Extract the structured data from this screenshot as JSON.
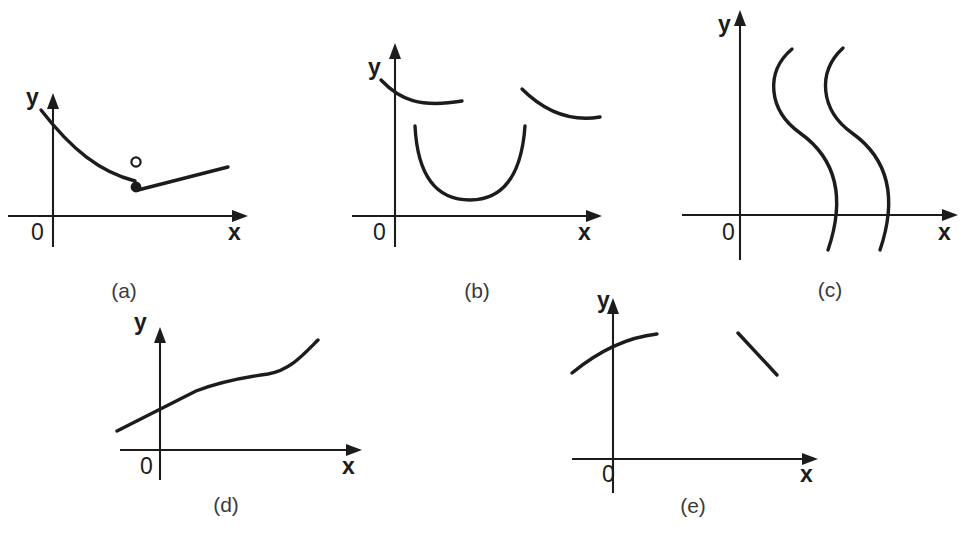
{
  "figure": {
    "width": 970,
    "height": 534,
    "background": "#ffffff",
    "ink_color": "#1c1c1c",
    "caption_color": "#3a3a3a"
  },
  "panels": [
    {
      "id": "a",
      "caption": "(a)",
      "caption_x": 124,
      "caption_y": 298,
      "axes": {
        "x_label": "x",
        "y_label": "y",
        "origin_label": "0",
        "x_label_x": 228,
        "x_label_y": 240,
        "y_label_x": 26,
        "y_label_y": 105,
        "origin_label_x": 31,
        "origin_label_y": 240,
        "x_axis_y": 216,
        "x_axis_x_start": 8,
        "x_axis_x_end": 248,
        "y_axis_x": 53,
        "y_axis_y_top": 93,
        "y_axis_y_bottom": 247
      },
      "curves": [
        {
          "name": "decreasing-branch",
          "path": "M 41 110 C 72 150 100 172 135 181"
        },
        {
          "name": "rising-segment",
          "path": "M 138 190 L 228 167"
        }
      ],
      "markers": [
        {
          "name": "open-circle-endpoint",
          "type": "open",
          "cx": 136,
          "cy": 162,
          "r": 4.6
        },
        {
          "name": "filled-dot-endpoint",
          "type": "filled",
          "cx": 136,
          "cy": 187,
          "r": 4.6
        }
      ]
    },
    {
      "id": "b",
      "caption": "(b)",
      "caption_x": 477,
      "caption_y": 298,
      "axes": {
        "x_label": "x",
        "y_label": "y",
        "origin_label": "0",
        "x_label_x": 578,
        "x_label_y": 240,
        "y_label_x": 368,
        "y_label_y": 75,
        "origin_label_x": 373,
        "origin_label_y": 240,
        "x_axis_y": 216,
        "x_axis_x_start": 352,
        "x_axis_x_end": 602,
        "y_axis_x": 395,
        "y_axis_y_top": 43,
        "y_axis_y_bottom": 247
      },
      "curves": [
        {
          "name": "upper-left-branch",
          "path": "M 381 80 C 400 100 420 108 462 101"
        },
        {
          "name": "upper-right-branch",
          "path": "M 522 89 C 545 112 570 122 600 117"
        },
        {
          "name": "lower-u-branch",
          "path": "M 415 126 C 418 185 443 200 470 200 C 498 200 521 182 525 126"
        }
      ],
      "markers": []
    },
    {
      "id": "c",
      "caption": "(c)",
      "caption_x": 830,
      "caption_y": 297,
      "axes": {
        "x_label": "x",
        "y_label": "y",
        "origin_label": "0",
        "x_label_x": 938,
        "x_label_y": 240,
        "y_label_x": 718,
        "y_label_y": 32,
        "origin_label_x": 722,
        "origin_label_y": 240,
        "x_axis_y": 215,
        "x_axis_x_start": 682,
        "x_axis_x_end": 958,
        "y_axis_x": 740,
        "y_axis_y_top": 10,
        "y_axis_y_bottom": 260
      },
      "curves": [
        {
          "name": "left-s-curve",
          "path": "M 792 49 C 765 72 768 110 800 133 C 838 160 845 200 828 250"
        },
        {
          "name": "right-s-curve",
          "path": "M 843 48 C 817 72 820 110 852 133 C 890 160 897 200 880 250"
        }
      ],
      "markers": []
    },
    {
      "id": "d",
      "caption": "(d)",
      "caption_x": 226,
      "caption_y": 512,
      "axes": {
        "x_label": "x",
        "y_label": "y",
        "origin_label": "0",
        "x_label_x": 342,
        "x_label_y": 474,
        "y_label_x": 134,
        "y_label_y": 330,
        "origin_label_x": 140,
        "origin_label_y": 474,
        "x_axis_y": 450,
        "x_axis_x_start": 120,
        "x_axis_x_end": 362,
        "y_axis_x": 160,
        "y_axis_y_top": 327,
        "y_axis_y_bottom": 480
      },
      "curves": [
        {
          "name": "piecewise-increasing-curve",
          "path": "M 117 431 L 196 391 C 222 381 246 377 268 374 C 290 370 302 356 318 340"
        }
      ],
      "markers": []
    },
    {
      "id": "e",
      "caption": "(e)",
      "caption_x": 693,
      "caption_y": 513,
      "axes": {
        "x_label": "x",
        "y_label": "y",
        "origin_label": "0",
        "x_label_x": 800,
        "x_label_y": 482,
        "y_label_x": 597,
        "y_label_y": 308,
        "origin_label_x": 602,
        "origin_label_y": 482,
        "x_axis_y": 459,
        "x_axis_x_start": 572,
        "x_axis_x_end": 818,
        "y_axis_x": 613,
        "y_axis_y_top": 298,
        "y_axis_y_bottom": 493
      },
      "curves": [
        {
          "name": "left-concave-arc",
          "path": "M 572 373 C 600 350 630 337 657 334"
        },
        {
          "name": "right-descending-segment",
          "path": "M 738 333 L 777 375"
        }
      ],
      "markers": []
    }
  ]
}
